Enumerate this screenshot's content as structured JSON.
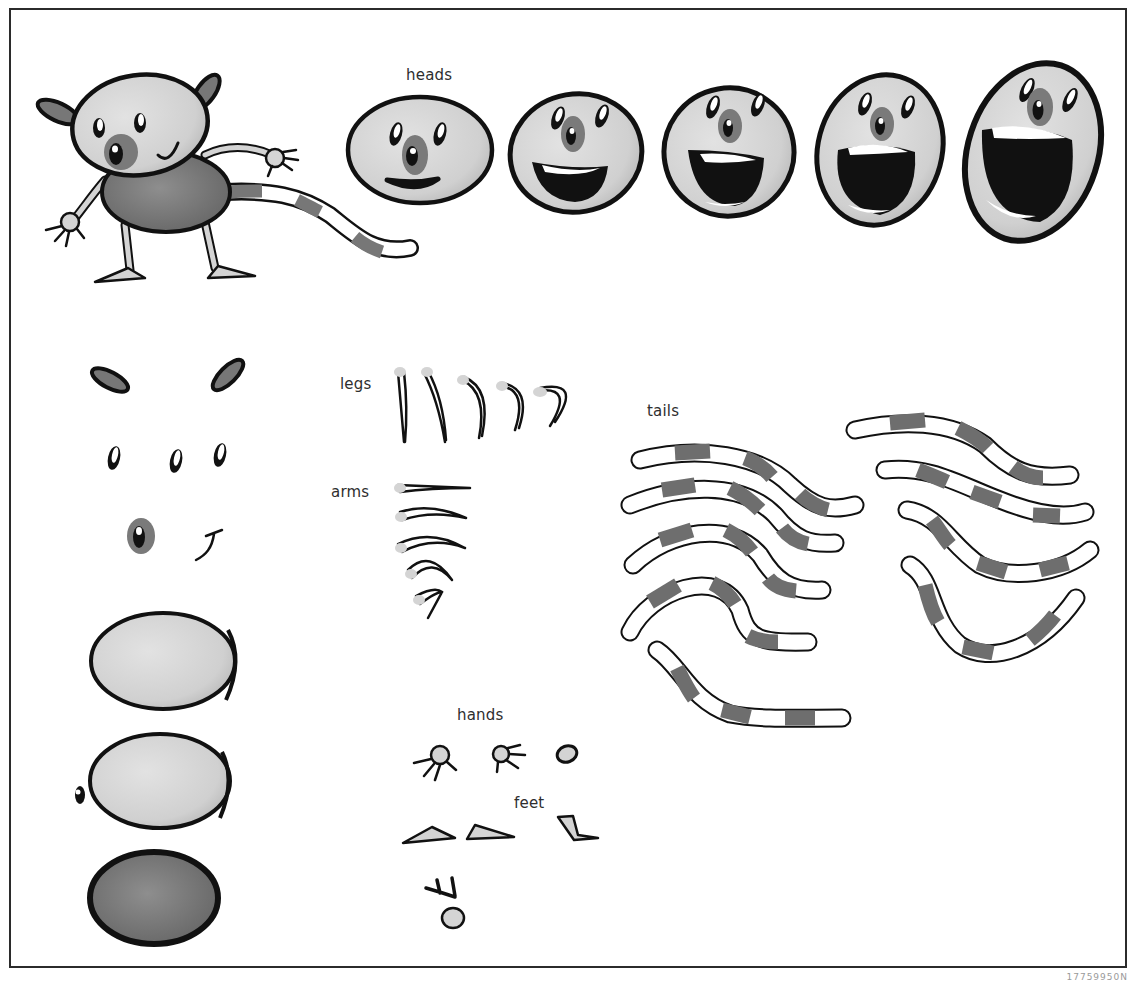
{
  "sheet": {
    "title": "Character parts sheet",
    "colors": {
      "outline": "#111111",
      "skin": "#d4d4d4",
      "dark_gray": "#7a7a7a",
      "body_gray": "#6e6e6e",
      "white": "#ffffff",
      "frame": "#2b2b2b"
    },
    "labels": {
      "heads": "heads",
      "legs": "legs",
      "arms": "arms",
      "tails": "tails",
      "hands": "hands",
      "feet": "feet"
    },
    "counts": {
      "heads": 5,
      "legs": 5,
      "arms": 5,
      "tails": 9,
      "hands": 3,
      "feet": 3,
      "eyes": 3,
      "ears": 2,
      "body_shapes": 3
    },
    "footer_code": "17759950N"
  }
}
